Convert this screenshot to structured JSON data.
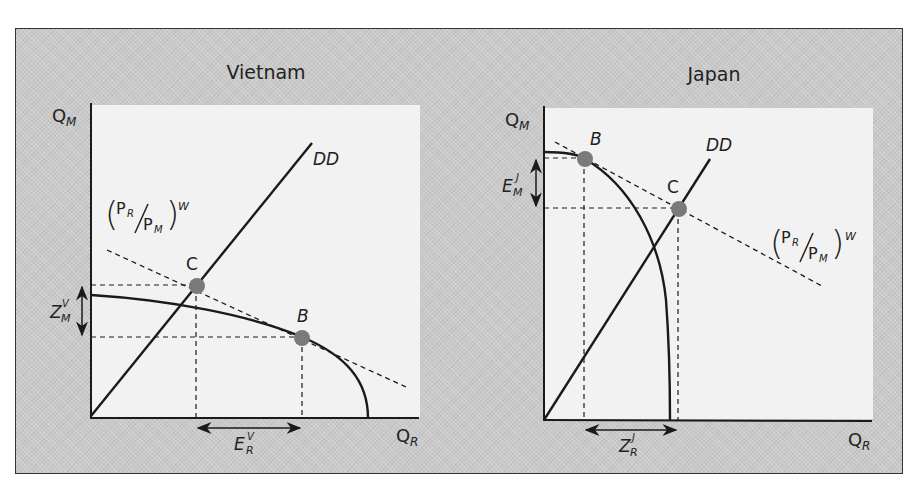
{
  "figure": {
    "panels": [
      {
        "title": "Vietnam",
        "y_axis_label": "Q",
        "y_axis_sub": "M",
        "x_axis_label": "Q",
        "x_axis_sub": "R",
        "curve_label": "DD",
        "price_line_label": {
          "num": "P",
          "num_sub": "R",
          "den": "P",
          "den_sub": "M",
          "sup": "W"
        },
        "point_c_label": "C",
        "point_b_label": "B",
        "vertical_arrow_label": {
          "main": "Z",
          "sub": "M",
          "sup": "V"
        },
        "horizontal_arrow_label": {
          "main": "E",
          "sub": "R",
          "sup": "V"
        }
      },
      {
        "title": "Japan",
        "y_axis_label": "Q",
        "y_axis_sub": "M",
        "x_axis_label": "Q",
        "x_axis_sub": "R",
        "curve_label": "DD",
        "price_line_label": {
          "num": "P",
          "num_sub": "R",
          "den": "P",
          "den_sub": "M",
          "sup": "W"
        },
        "point_b_label": "B",
        "point_c_label": "C",
        "vertical_arrow_label": {
          "main": "E",
          "sub": "M",
          "sup": "J"
        },
        "horizontal_arrow_label": {
          "main": "Z",
          "sub": "R",
          "sup": "J"
        }
      }
    ],
    "colors": {
      "frame_bg": "#c9c9c9",
      "plot_bg": "#f2f2f2",
      "line": "#1a1a1a",
      "point": "#7a7a7a"
    }
  }
}
